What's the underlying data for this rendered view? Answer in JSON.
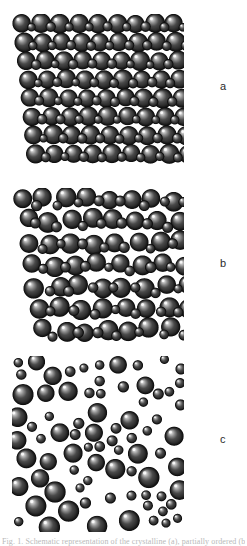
{
  "figure": {
    "background_color": "#ffffff",
    "sphere_body_color": "#4a4a4a",
    "sphere_dark_color": "#171717",
    "sphere_highlight_color": "#e8e8e8",
    "sphere_outline_color": "#0d0d0d",
    "label_color": "#2b2b2b"
  },
  "panels": [
    {
      "id": "panel-a",
      "label": "a",
      "label_x": 220,
      "label_y": 81,
      "state_name": "ordered-crystalline",
      "x": 12,
      "y": 14,
      "width": 172,
      "height": 152,
      "layout": "lattice",
      "columns": 9,
      "rows": 8,
      "spacing_x": 19.0,
      "spacing_y": 18.6,
      "offset_x": 10.0,
      "offset_y": 9.5,
      "row_stagger": 2.0,
      "large_radius": 9.4,
      "small_radius": 4.6,
      "jitter": 0.7,
      "seed": 1741
    },
    {
      "id": "panel-b",
      "label": "b",
      "label_x": 220,
      "label_y": 258,
      "state_name": "partially-ordered",
      "x": 12,
      "y": 188,
      "width": 172,
      "height": 158,
      "layout": "lattice",
      "columns": 8,
      "rows": 7,
      "spacing_x": 21.6,
      "spacing_y": 21.8,
      "offset_x": 11.0,
      "offset_y": 11.0,
      "row_stagger": 3.4,
      "large_radius": 9.6,
      "small_radius": 5.0,
      "jitter": 3.0,
      "seed": 8823
    },
    {
      "id": "panel-c",
      "label": "c",
      "label_x": 220,
      "label_y": 434,
      "state_name": "disordered-amorphous",
      "x": 12,
      "y": 356,
      "width": 172,
      "height": 176,
      "layout": "random",
      "count": 78,
      "large_radius": 9.6,
      "small_radius": 5.0,
      "large_fraction": 0.62,
      "min_gap": 0.6,
      "seed": 4517
    }
  ],
  "caption": {
    "text": "Fig. 1. Schematic representation of the crystalline (a), partially ordered (b)",
    "y": 537
  }
}
